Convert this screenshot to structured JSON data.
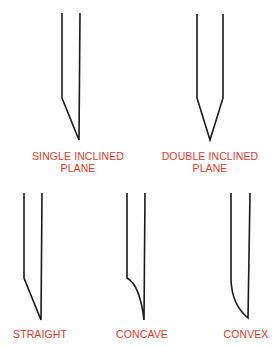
{
  "diagram": {
    "stroke_color": "#1a1a1a",
    "label_color": "#e0392b",
    "bevels": [
      {
        "id": "single-inclined",
        "label_line1": "SINGLE INCLINED",
        "label_line2": "PLANE"
      },
      {
        "id": "double-inclined",
        "label_line1": "DOUBLE INCLINED",
        "label_line2": "PLANE"
      },
      {
        "id": "straight",
        "label_line1": "STRAIGHT"
      },
      {
        "id": "concave",
        "label_line1": "CONCAVE"
      },
      {
        "id": "convex",
        "label_line1": "CONVEX"
      }
    ]
  }
}
